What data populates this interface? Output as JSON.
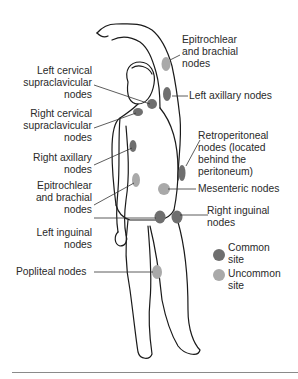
{
  "diagram": {
    "labels": {
      "epitrochlear_brachial_left": "Epitrochlear\nand brachial\nnodes",
      "left_cervical": "Left cervical\nsupraclavicular\nnodes",
      "left_axillary": "Left axillary nodes",
      "right_cervical": "Right cervical\nsupraclavicular\nnodes",
      "retroperitoneal": "Retroperitoneal\nnodes (located\nbehind the\nperitoneum)",
      "right_axillary": "Right axillary\nnodes",
      "mesenteric": "Mesenteric nodes",
      "epitrochlear_brachial_right": "Epitrochlear\nand brachial\nnodes",
      "right_inguinal": "Right inguinal\nnodes",
      "left_inguinal": "Left inguinal\nnodes",
      "popliteal": "Popliteal nodes"
    },
    "legend": {
      "common": "Common\nsite",
      "uncommon": "Uncommon\nsite"
    },
    "colors": {
      "common": "#6f6f6f",
      "uncommon": "#a9a9a9",
      "outline": "#1a1a1a",
      "rule": "#8a8a8a"
    }
  }
}
